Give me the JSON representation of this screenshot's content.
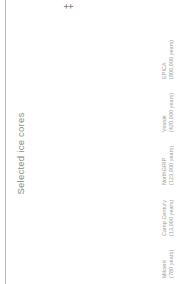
{
  "chart_data": {
    "type": "bar",
    "title": "Selected ice cores",
    "xlabel": "",
    "ylabel": "",
    "orientation": "horizontal-rotated",
    "grid": false,
    "legend": null,
    "unit": "years",
    "categories": [
      "EPICA",
      "Vostok",
      "NorthGRIP",
      "Camp Century",
      "Milcent"
    ],
    "value_labels": [
      "(800,000 years)",
      "(420,000 years)",
      "(123,000 years)",
      "(13,000 years)",
      "(780 years)"
    ],
    "values": [
      800000,
      420000,
      123000,
      13000,
      780
    ],
    "xlim": [
      0,
      800000
    ],
    "bar_fill_start_color": "#dcdcdc",
    "bar_fill_end_color": "#5e5e5e",
    "label_color": "#9a9a9a",
    "title_color": "#8c8c8c",
    "axis_rule_color": "#b9b9b9"
  },
  "marker": {
    "glyph": "‡"
  }
}
